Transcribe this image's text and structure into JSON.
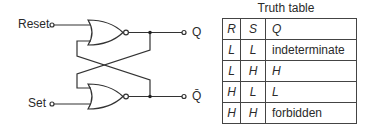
{
  "diagram": {
    "inputs": [
      {
        "label": "Reset"
      },
      {
        "label": "Set"
      }
    ],
    "outputs": [
      {
        "label": "Q"
      },
      {
        "label": "Q̄"
      }
    ],
    "gates": [
      {
        "type": "NOR",
        "name": "top"
      },
      {
        "type": "NOR",
        "name": "bottom"
      }
    ]
  },
  "truth_table": {
    "title": "Truth table",
    "headers": [
      "R",
      "S",
      "Q"
    ],
    "rows": [
      [
        "L",
        "L",
        "indeterminate"
      ],
      [
        "L",
        "H",
        "H"
      ],
      [
        "H",
        "L",
        "L"
      ],
      [
        "H",
        "H",
        "forbidden"
      ]
    ]
  }
}
